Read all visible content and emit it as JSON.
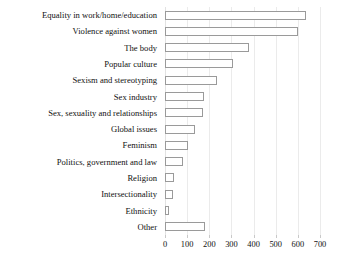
{
  "chart_data": {
    "type": "bar",
    "orientation": "horizontal",
    "title": "",
    "subtitle": "",
    "xlabel": "",
    "ylabel": "",
    "xlim": [
      0,
      700
    ],
    "grid": true,
    "legend": null,
    "xticks": [
      0,
      100,
      200,
      300,
      400,
      500,
      600,
      700
    ],
    "xtick_labels": [
      "0",
      "100",
      "200",
      "300",
      "400",
      "500",
      "600",
      "700"
    ],
    "categories": [
      "Equality in work/home/education",
      "Violence against women",
      "The body",
      "Popular culture",
      "Sexism and stereotyping",
      "Sex industry",
      "Sex, sexuality and relationships",
      "Global issues",
      "Feminism",
      "Politics, government and law",
      "Religion",
      "Intersectionality",
      "Ethnicity",
      "Other"
    ],
    "values": [
      635,
      600,
      380,
      305,
      235,
      175,
      170,
      135,
      105,
      80,
      40,
      38,
      20,
      180
    ],
    "bar_fill": "#ffffff",
    "bar_edge": "#9a9a9a",
    "grid_color": "#ebebeb"
  }
}
